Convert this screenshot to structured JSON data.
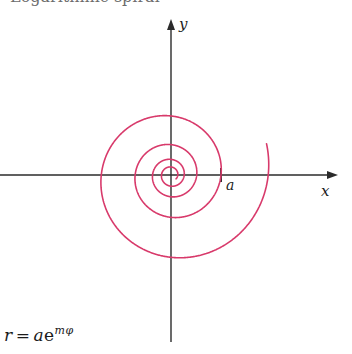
{
  "figure": {
    "kind": "polar-plot",
    "background_color": "#ffffff",
    "width": 352,
    "height": 354
  },
  "axes": {
    "origin": {
      "x": 171,
      "y": 175
    },
    "x_axis": {
      "label": "x",
      "color": "#2b2b2b",
      "start": {
        "x": 0,
        "y": 175
      },
      "end": {
        "x": 340,
        "y": 175
      },
      "arrow": "right"
    },
    "y_axis": {
      "label": "y",
      "color": "#2b2b2b",
      "start": {
        "x": 171,
        "y": 340
      },
      "end": {
        "x": 171,
        "y": 17
      },
      "arrow": "up"
    },
    "tick": {
      "label": "a",
      "x": 221,
      "y": 175,
      "half_height": 7
    }
  },
  "annotations": {
    "formula_r": "r",
    "formula_equals": "=",
    "formula_a": "a",
    "formula_e": "e",
    "formula_exponent": "mφ",
    "formula_plain": "r = ae^{mφ}",
    "cropped_caption_above": "Logarithmic spiral"
  },
  "chart_data": {
    "type": "line",
    "title": "",
    "subtitle": "",
    "xlabel": "x",
    "ylabel": "y",
    "curve_name": "logarithmic spiral",
    "equation": "r = a e^{m phi}",
    "polar": true,
    "parameters": {
      "a": 50,
      "m": 0.1058,
      "phi_min": -19.5,
      "phi_max": 6.6,
      "growth_per_turn": 1.95
    },
    "stroke_color": "#d83a6b",
    "stroke_width": 1.6,
    "axis_color": "#2b2b2b",
    "axis_stroke_width": 1.4,
    "scale_px_per_unit": 1,
    "notable_points": [
      {
        "phi": 0,
        "r": 50,
        "label": "a",
        "x": 221,
        "y": 175
      },
      {
        "phi": -6.283,
        "r": 25.6,
        "label": "",
        "x": 197,
        "y": 175
      },
      {
        "phi": -12.566,
        "r": 13.1,
        "label": "",
        "x": 184,
        "y": 175
      },
      {
        "phi": -18.85,
        "r": 6.7,
        "label": "",
        "x": 178,
        "y": 175
      },
      {
        "phi": 6.283,
        "r": 97.5,
        "label": "",
        "x": 268,
        "y": 175
      }
    ],
    "x_axis_crossings_px": [
      176,
      183,
      197,
      221,
      268
    ],
    "negative_x_crossings_px": [
      32,
      139,
      163,
      169
    ],
    "grid": false,
    "legend": false,
    "legend_position": "none"
  }
}
